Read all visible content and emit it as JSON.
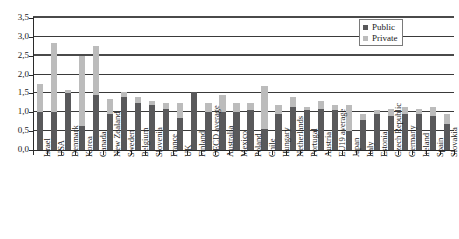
{
  "chart_data": {
    "type": "bar",
    "subtype": "stacked-vertical",
    "title": "",
    "subtitle": "",
    "xlabel": "",
    "ylabel": "",
    "ylim": [
      0.0,
      3.5
    ],
    "ytick_values": [
      0.0,
      0.5,
      1.0,
      1.5,
      2.0,
      2.5,
      3.0,
      3.5
    ],
    "ytick_labels": [
      "0,0",
      "0,5",
      "1,0",
      "1,5",
      "2,0",
      "2,5",
      "3,0",
      "3,5"
    ],
    "grid": true,
    "grid_axis": "y",
    "legend_position": "top-right",
    "decimal_separator": ",",
    "categories": [
      "Israel",
      "USA",
      "Denmark",
      "Korea",
      "Canada",
      "New Zealand",
      "Sweden",
      "Belgium",
      "Slovenia",
      "France",
      "UK",
      "Finland",
      "OECD average",
      "Australia",
      "Mexico",
      "Poland",
      "Chile",
      "Hungary",
      "Netherlands",
      "Portugal",
      "Austria",
      "EU19 average",
      "Japan",
      "Italy",
      "Estonia",
      "Czech Republic",
      "Germany",
      "Ireland",
      "Spain",
      "Slovakia"
    ],
    "series": [
      {
        "name": "Public",
        "color": "#59595b",
        "values": [
          1.0,
          1.0,
          1.5,
          0.65,
          1.45,
          0.95,
          1.4,
          1.25,
          1.2,
          1.1,
          0.85,
          1.55,
          1.0,
          1.0,
          1.0,
          1.05,
          0.55,
          0.95,
          1.15,
          1.05,
          1.1,
          1.05,
          0.5,
          0.8,
          0.95,
          0.9,
          0.95,
          0.95,
          0.9,
          0.7
        ]
      },
      {
        "name": "Private",
        "color": "#bcbcbc",
        "values": [
          0.75,
          1.85,
          0.1,
          1.85,
          1.3,
          0.4,
          0.15,
          0.15,
          0.1,
          0.15,
          0.4,
          0.0,
          0.25,
          0.45,
          0.25,
          0.2,
          1.15,
          0.25,
          0.25,
          0.1,
          0.2,
          0.15,
          0.7,
          0.15,
          0.1,
          0.2,
          0.2,
          0.15,
          0.25,
          0.25
        ]
      }
    ],
    "totals": [
      1.75,
      2.85,
      1.6,
      2.5,
      2.75,
      1.35,
      1.55,
      1.4,
      1.3,
      1.25,
      1.25,
      1.55,
      1.25,
      1.45,
      1.25,
      1.25,
      1.7,
      1.2,
      1.4,
      1.15,
      1.3,
      1.2,
      1.2,
      0.95,
      1.05,
      1.1,
      1.15,
      1.1,
      1.15,
      0.95
    ]
  },
  "legend": {
    "items": [
      {
        "label": "Public"
      },
      {
        "label": "Private"
      }
    ]
  },
  "colors": {
    "public": "#59595b",
    "private": "#bcbcbc",
    "axis": "#2b2b2b",
    "grid": "#3a3a3a",
    "background": "#ffffff"
  }
}
